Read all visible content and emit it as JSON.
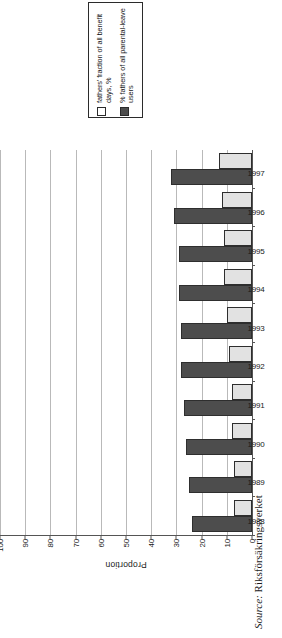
{
  "legend": {
    "position": "top",
    "items": [
      {
        "swatch": "open-square-swatch",
        "label": "fathers' fraction of all benefit days, %"
      },
      {
        "swatch": "solid-square-swatch",
        "label": "% fathers of all parental-leave users"
      }
    ]
  },
  "source": {
    "label": "Source:",
    "value": "Riksförsäkringsverket"
  },
  "chart_data": {
    "type": "bar",
    "title": "",
    "xlabel": "",
    "ylabel": "Proportion",
    "ylim": [
      0,
      100
    ],
    "ytick_step": 10,
    "yticks": [
      0,
      10,
      20,
      30,
      40,
      50,
      60,
      70,
      80,
      90,
      100
    ],
    "grid": true,
    "orientation": "rotated-90-ccw",
    "categories": [
      "1988",
      "1989",
      "1990",
      "1991",
      "1992",
      "1993",
      "1994",
      "1995",
      "1996",
      "1997"
    ],
    "series": [
      {
        "name": "% fathers of all parental-leave users",
        "color": "#4d4d4d",
        "values": [
          24,
          25,
          26,
          27,
          28,
          28,
          29,
          29,
          31,
          32
        ]
      },
      {
        "name": "fathers' fraction of all benefit days, %",
        "color": "#e2e2e2",
        "values": [
          7,
          7,
          8,
          8,
          9,
          10,
          11,
          11,
          12,
          13
        ]
      }
    ]
  }
}
